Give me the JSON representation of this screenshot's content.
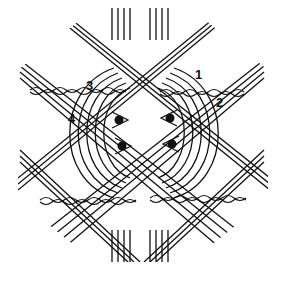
{
  "diagram": {
    "type": "bobbin lace pattern",
    "stroke_color": "#111111",
    "background": "#ffffff",
    "labels": [
      {
        "text": "1",
        "x": 195,
        "y": 68
      },
      {
        "text": "2",
        "x": 216,
        "y": 96
      },
      {
        "text": "3",
        "x": 86,
        "y": 79
      },
      {
        "text": "4",
        "x": 68,
        "y": 112
      }
    ],
    "pins": [
      {
        "x": 119,
        "y": 120
      },
      {
        "x": 122,
        "y": 146
      },
      {
        "x": 170,
        "y": 118
      },
      {
        "x": 172,
        "y": 144
      }
    ]
  }
}
